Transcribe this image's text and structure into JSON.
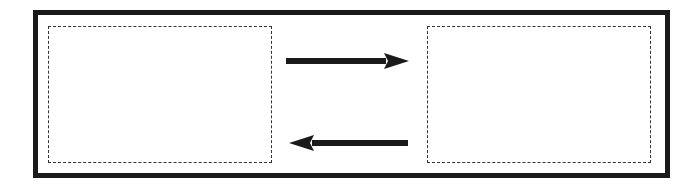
{
  "diagram": {
    "frame": {
      "border_color": "#1a1a1a"
    },
    "panels": [
      {
        "id": "left",
        "label": ""
      },
      {
        "id": "right",
        "label": ""
      }
    ],
    "arrows": [
      {
        "direction": "right",
        "from": "left",
        "to": "right",
        "color": "#1a1a1a"
      },
      {
        "direction": "left",
        "from": "right",
        "to": "left",
        "color": "#1a1a1a"
      }
    ]
  }
}
